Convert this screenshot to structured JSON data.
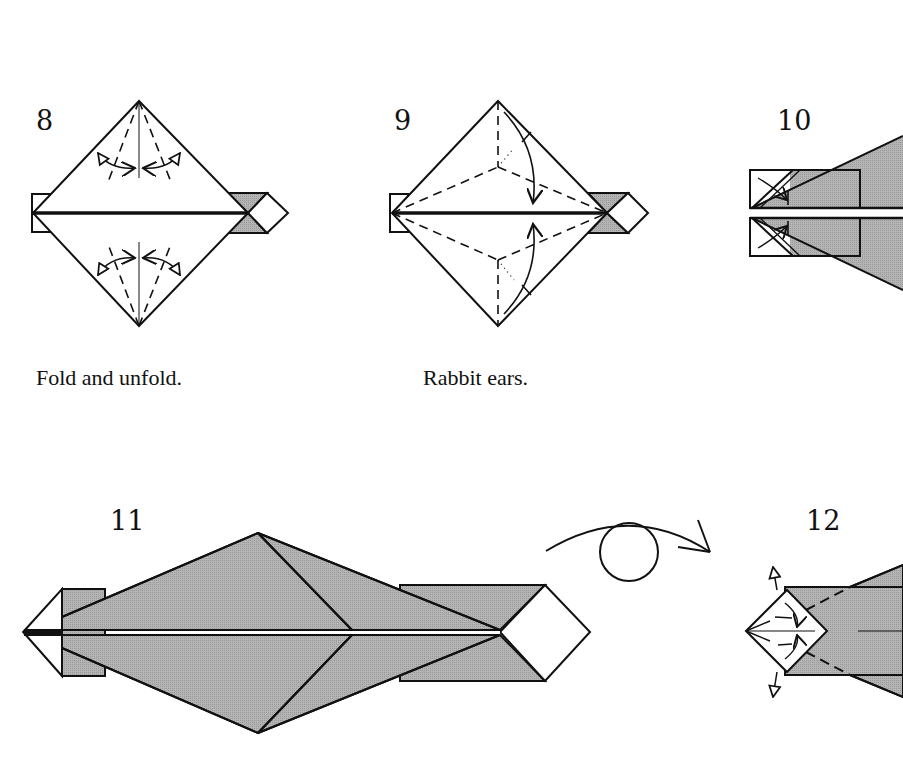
{
  "colors": {
    "paper": "#ffffff",
    "shaded": "#a9a9a9",
    "line": "#111111"
  },
  "steps": [
    {
      "number": "8",
      "caption": "Fold and unfold."
    },
    {
      "number": "9",
      "caption": "Rabbit ears."
    },
    {
      "number": "10",
      "caption": ""
    },
    {
      "number": "11",
      "caption": ""
    },
    {
      "number": "12",
      "caption": ""
    }
  ],
  "symbols": {
    "turn_over": "turn-over-icon"
  }
}
